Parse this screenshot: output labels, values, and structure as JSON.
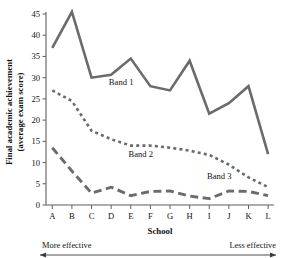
{
  "chart_data": {
    "type": "line",
    "title": "",
    "xlabel": "School",
    "ylabel": "Final academic achievement (average exam score)",
    "ylabel_line1": "Final academic achievement",
    "ylabel_line2": "(average exam score)",
    "categories": [
      "A",
      "B",
      "C",
      "D",
      "E",
      "F",
      "G",
      "H",
      "I",
      "J",
      "K",
      "L"
    ],
    "ylim": [
      0,
      45
    ],
    "yticks": [
      0,
      5,
      10,
      15,
      20,
      25,
      30,
      35,
      40,
      45
    ],
    "ytick_labels": [
      "0",
      "5",
      "10",
      "15",
      "20",
      "25",
      "30",
      "35",
      "40",
      "45"
    ],
    "grid": false,
    "legend_position": "inline-annotations",
    "series": [
      {
        "name": "Band 1",
        "style": "solid",
        "color": "#6b6b6b",
        "width": 2.6,
        "values": [
          37,
          45.5,
          30,
          30.7,
          34.5,
          28,
          27,
          34,
          21.5,
          24,
          28,
          12
        ],
        "label_x_category": "D",
        "label_value": 28.3
      },
      {
        "name": "Band 2",
        "style": "dotted",
        "color": "#6b6b6b",
        "width": 2.6,
        "values": [
          27,
          24.5,
          17.5,
          15.5,
          14,
          14,
          13.5,
          12.8,
          11.8,
          9.5,
          6.5,
          4.2
        ],
        "label_x_category": "E",
        "label_value": 11.3
      },
      {
        "name": "Band 3",
        "style": "dashed",
        "color": "#6b6b6b",
        "width": 2.9,
        "values": [
          13.5,
          8,
          2.8,
          4.2,
          2.2,
          3.2,
          3.3,
          2.1,
          1.5,
          3.3,
          3.2,
          2.2
        ],
        "label_x_category": "I",
        "label_value": 6.2
      }
    ],
    "annotations": [
      {
        "name": "more-effective",
        "text": "More effective",
        "align": "left"
      },
      {
        "name": "less-effective",
        "text": "Less effective",
        "align": "right"
      }
    ],
    "direction_arrow": {
      "double_headed": true,
      "from_label": "More effective",
      "to_label": "Less effective"
    }
  },
  "colors": {
    "series_line": "#6b6b6b",
    "axis": "#5e5e5e",
    "text": "#111111",
    "background": "#ffffff"
  }
}
